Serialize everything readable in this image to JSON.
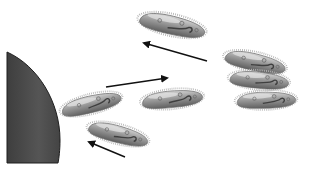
{
  "figure": {
    "colors": {
      "background": "#ffffff",
      "obstacle": "#4a4a4a",
      "obstacle_edge": "#1e1e1e",
      "cell_body": "#9a9a9a",
      "cell_highlight": "#d6d6d6",
      "cell_dark": "#5e5e5e",
      "cilia": "#b0b0b0",
      "arrow": "#111111"
    },
    "organisms": [
      {
        "id": "paramecium-top",
        "cx": 172,
        "cy": 25,
        "rx": 38,
        "ry": 11,
        "rotate": 12
      },
      {
        "id": "paramecium-near-obstacle",
        "cx": 90,
        "cy": 104,
        "rx": 34,
        "ry": 10,
        "rotate": -14
      },
      {
        "id": "paramecium-middle",
        "cx": 172,
        "cy": 99,
        "rx": 33,
        "ry": 10,
        "rotate": -6
      },
      {
        "id": "paramecium-lower",
        "cx": 118,
        "cy": 134,
        "rx": 33,
        "ry": 11,
        "rotate": 14
      },
      {
        "id": "paramecium-cluster-1",
        "cx": 255,
        "cy": 62,
        "rx": 34,
        "ry": 10,
        "rotate": 12
      },
      {
        "id": "paramecium-cluster-2",
        "cx": 259,
        "cy": 80,
        "rx": 32,
        "ry": 10,
        "rotate": 5
      },
      {
        "id": "paramecium-cluster-3",
        "cx": 265,
        "cy": 100,
        "rx": 32,
        "ry": 10,
        "rotate": -2
      }
    ],
    "arrows": [
      {
        "id": "arrow-top-left",
        "x1": 207,
        "y1": 61,
        "x2": 142,
        "y2": 42
      },
      {
        "id": "arrow-right",
        "x1": 106,
        "y1": 87,
        "x2": 169,
        "y2": 78
      },
      {
        "id": "arrow-bottom-left",
        "x1": 125,
        "y1": 157,
        "x2": 87,
        "y2": 141
      }
    ]
  }
}
